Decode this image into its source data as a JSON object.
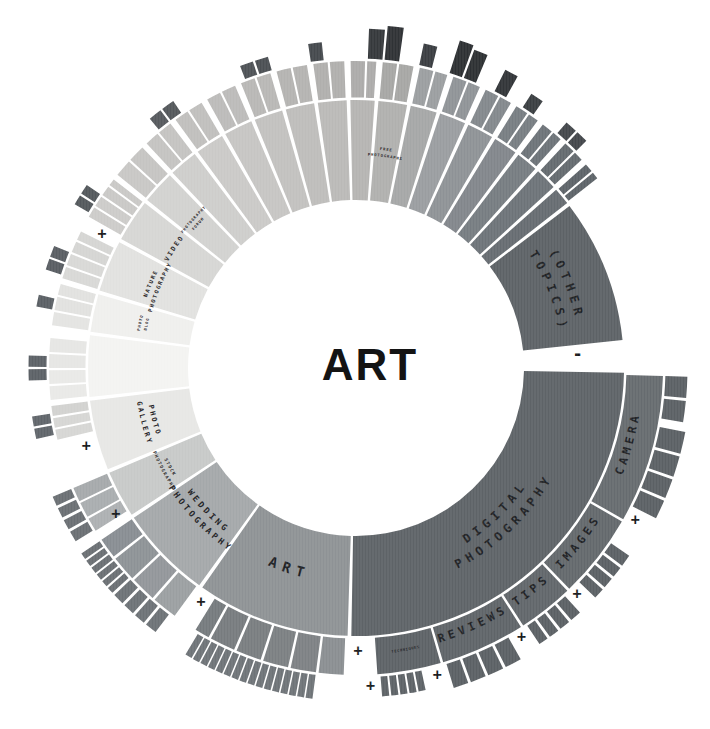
{
  "center": {
    "label": "ART"
  },
  "chart_data": {
    "type": "sunburst",
    "title": "ART",
    "geometry": {
      "cx": 356,
      "cy": 368,
      "ring1": [
        168,
        268
      ],
      "ring2": [
        270.5,
        307
      ],
      "ring3_base": 309.5,
      "label_r1": 216,
      "label_r2": 287
    },
    "ring1": [
      {
        "id": "digital-photography",
        "a0": 91,
        "a1": 181,
        "color": "#5e6367",
        "lines": [
          "DIGITAL",
          "PHOTOGRAPHY"
        ],
        "fs": 12,
        "ls": 5
      },
      {
        "id": "art",
        "a0": 181.8,
        "a1": 215,
        "color": "#8e9295",
        "lines": [
          "ART"
        ],
        "fs": 14,
        "ls": 6
      },
      {
        "id": "wedding-photography",
        "a0": 215.8,
        "a1": 236,
        "color": "#a4a8aa",
        "lines": [
          "WEDDING",
          "PHOTOGRAPHY"
        ],
        "fs": 8.5,
        "ls": 3
      },
      {
        "id": "stock-photography",
        "a0": 236.8,
        "a1": 247,
        "color": "#c7c9c8",
        "lines": [
          "STOCK",
          "PHOTOGRAPHY"
        ],
        "fs": 4.5,
        "ls": 1.2,
        "lc": "#55585a"
      },
      {
        "id": "photo-gallery",
        "a0": 247.8,
        "a1": 263,
        "color": "#e7e7e5",
        "lines": [
          "PHOTO",
          "GALLERY"
        ],
        "fs": 7,
        "ls": 2.2,
        "lc": "#4a4c4e"
      },
      {
        "id": "untitled-pale",
        "a0": 263.8,
        "a1": 277,
        "color": "#f3f3f1"
      },
      {
        "id": "photo-blog",
        "a0": 277.8,
        "a1": 286,
        "color": "#efefed",
        "lines": [
          "PHOTO",
          "BLOG"
        ],
        "fs": 3.8,
        "ls": 1,
        "lc": "#77797a"
      },
      {
        "id": "nature-photography",
        "a0": 286.8,
        "a1": 298,
        "color": "#e1e1df",
        "lines": [
          "NATURE",
          "PHOTOGRAPHY"
        ],
        "fs": 5.5,
        "ls": 1.5,
        "lc": "#55585a"
      },
      {
        "id": "video",
        "a0": 298.8,
        "a1": 308,
        "color": "#d6d6d4",
        "lines": [
          "VIDEO"
        ],
        "fs": 6.5,
        "ls": 2,
        "lc": "#3c3f41"
      },
      {
        "id": "photography-forum",
        "a0": 308.8,
        "a1": 316,
        "color": "#d2d2d0",
        "lines": [
          "PHOTOGRAPHY",
          "FORUM"
        ],
        "fs": 3.8,
        "ls": 0.9,
        "lc": "#55585a"
      },
      {
        "a0": 316.8,
        "a1": 323,
        "color": "#cecdcb"
      },
      {
        "a0": 323.8,
        "a1": 330,
        "color": "#cac9c7"
      },
      {
        "a0": 330.8,
        "a1": 337,
        "color": "#c6c5c3"
      },
      {
        "a0": 337.8,
        "a1": 344,
        "color": "#c2c1bf"
      },
      {
        "a0": 344.8,
        "a1": 351,
        "color": "#bebdbb"
      },
      {
        "a0": 351.8,
        "a1": 358,
        "color": "#bab9b7"
      },
      {
        "a0": 358.8,
        "a1": 364,
        "color": "#b5b4b2"
      },
      {
        "id": "free-photographs",
        "a0": 364.8,
        "a1": 371,
        "color": "#b0b0ae",
        "lines": [
          "FREE",
          "PHOTOGRAPHS"
        ],
        "fs": 3.8,
        "ls": 0.9,
        "lc": "#55585a"
      },
      {
        "a0": 371.8,
        "a1": 377.5,
        "color": "#a5a7a7"
      },
      {
        "a0": 378.3,
        "a1": 384,
        "color": "#9a9da0"
      },
      {
        "a0": 384.8,
        "a1": 390.5,
        "color": "#8e9296"
      },
      {
        "a0": 391.3,
        "a1": 396.5,
        "color": "#82868b"
      },
      {
        "a0": 397.3,
        "a1": 402,
        "color": "#767c81"
      },
      {
        "a0": 402.8,
        "a1": 407.5,
        "color": "#6d7378"
      },
      {
        "a0": 408.3,
        "a1": 412,
        "color": "#666c71"
      },
      {
        "id": "other-topics",
        "a0": 412.8,
        "a1": 444,
        "color": "#5d6266",
        "lines": [
          "(OTHER",
          "TOPICS)"
        ],
        "fs": 12,
        "ls": 5
      }
    ],
    "ring2": [
      {
        "id": "camera",
        "a0": 91.5,
        "a1": 119.5,
        "color": "#666b6f",
        "lines": [
          "CAMERA"
        ],
        "fs": 11.5,
        "ls": 4
      },
      {
        "id": "images",
        "a0": 120,
        "a1": 136,
        "color": "#63686c",
        "lines": [
          "IMAGES"
        ],
        "fs": 11.5,
        "ls": 4
      },
      {
        "id": "tips",
        "a0": 136.5,
        "a1": 147,
        "color": "#61666a",
        "lines": [
          "TIPS"
        ],
        "fs": 11.5,
        "ls": 4
      },
      {
        "id": "reviews",
        "a0": 147.5,
        "a1": 163.5,
        "color": "#5f6468",
        "lines": [
          "REVIEWS"
        ],
        "fs": 11.5,
        "ls": 4
      },
      {
        "id": "techniques",
        "a0": 164,
        "a1": 176,
        "color": "#5d6266",
        "lines": [
          "TECHNIQUES"
        ],
        "fs": 3.6,
        "ls": 0.7,
        "lc": "#2c2f31"
      },
      {
        "a0": 182.3,
        "a1": 187,
        "color": "#8a8e91"
      },
      {
        "a0": 187.5,
        "a1": 192.3,
        "color": "#7d8184"
      },
      {
        "a0": 192.8,
        "a1": 197.6,
        "color": "#7b7f82"
      },
      {
        "a0": 198.1,
        "a1": 202.9,
        "color": "#797d80"
      },
      {
        "a0": 203.4,
        "a1": 208.2,
        "color": "#777b7e"
      },
      {
        "a0": 208.7,
        "a1": 211.5,
        "color": "#757a7d"
      },
      {
        "a0": 216.2,
        "a1": 221,
        "color": "#9b9fa1"
      },
      {
        "a0": 221.5,
        "a1": 226.3,
        "color": "#92969a"
      },
      {
        "a0": 226.8,
        "a1": 231.6,
        "color": "#8d9296"
      },
      {
        "a0": 232.1,
        "a1": 236,
        "color": "#888d92"
      },
      {
        "a0": 238,
        "a1": 240.6,
        "color": "#adb0b2"
      },
      {
        "a0": 241,
        "a1": 243.9,
        "color": "#a9adaf"
      },
      {
        "a0": 244.3,
        "a1": 247,
        "color": "#a5a9ab"
      },
      {
        "a0": 256.5,
        "a1": 258.4,
        "color": "#d6d6d4"
      },
      {
        "a0": 258.8,
        "a1": 260.6,
        "color": "#d6d6d4"
      },
      {
        "a0": 261,
        "a1": 262.9,
        "color": "#d2d2d0"
      },
      {
        "a0": 264,
        "a1": 266.6,
        "color": "#e9e9e7"
      },
      {
        "a0": 267,
        "a1": 269.6,
        "color": "#e9e9e7"
      },
      {
        "a0": 270,
        "a1": 272.6,
        "color": "#e6e6e4"
      },
      {
        "a0": 273,
        "a1": 275.6,
        "color": "#e6e6e4"
      },
      {
        "a0": 278,
        "a1": 280.5,
        "color": "#e4e4e2"
      },
      {
        "a0": 280.9,
        "a1": 283.4,
        "color": "#e1e1df"
      },
      {
        "a0": 283.8,
        "a1": 285.9,
        "color": "#e1e1df"
      },
      {
        "a0": 287,
        "a1": 289.2,
        "color": "#d8d8d6"
      },
      {
        "a0": 289.6,
        "a1": 291.8,
        "color": "#d8d8d6"
      },
      {
        "a0": 292.2,
        "a1": 294.3,
        "color": "#d5d5d3"
      },
      {
        "a0": 294.7,
        "a1": 296.4,
        "color": "#d5d5d3"
      },
      {
        "a0": 299.5,
        "a1": 301.5,
        "color": "#cccbc9"
      },
      {
        "a0": 301.9,
        "a1": 303.9,
        "color": "#cccbc9"
      },
      {
        "a0": 304.3,
        "a1": 306.2,
        "color": "#c9c8c6"
      },
      {
        "a0": 306.6,
        "a1": 307.9,
        "color": "#c9c8c6"
      },
      {
        "a0": 309,
        "a1": 312.3,
        "color": "#c8c7c5"
      },
      {
        "a0": 312.7,
        "a1": 315.9,
        "color": "#c5c4c2"
      },
      {
        "a0": 317,
        "a1": 319.7,
        "color": "#c4c3c1"
      },
      {
        "a0": 320.1,
        "a1": 322.8,
        "color": "#c4c3c1"
      },
      {
        "a0": 324,
        "a1": 326.7,
        "color": "#c0bfbd"
      },
      {
        "a0": 327.1,
        "a1": 329.8,
        "color": "#c0bfbd"
      },
      {
        "a0": 331,
        "a1": 333.7,
        "color": "#bcbbb9"
      },
      {
        "a0": 334.1,
        "a1": 336.8,
        "color": "#bcbbb9"
      },
      {
        "a0": 338,
        "a1": 340.7,
        "color": "#b8b7b5"
      },
      {
        "a0": 341.1,
        "a1": 343.8,
        "color": "#b8b7b5"
      },
      {
        "a0": 345,
        "a1": 347.7,
        "color": "#b4b3b1"
      },
      {
        "a0": 348.1,
        "a1": 350.8,
        "color": "#b4b3b1"
      },
      {
        "a0": 352,
        "a1": 354.7,
        "color": "#b0afad"
      },
      {
        "a0": 355.1,
        "a1": 357.8,
        "color": "#b0afad"
      },
      {
        "a0": 359,
        "a1": 361.7,
        "color": "#acabaa"
      },
      {
        "a0": 362.1,
        "a1": 363.8,
        "color": "#acabaa"
      },
      {
        "a0": 365,
        "a1": 367.7,
        "color": "#a6a6a4"
      },
      {
        "a0": 368.1,
        "a1": 370.8,
        "color": "#a6a6a4"
      },
      {
        "a0": 372,
        "a1": 374.6,
        "color": "#9b9ea0"
      },
      {
        "a0": 375,
        "a1": 377.3,
        "color": "#9b9ea0"
      },
      {
        "a0": 378.5,
        "a1": 381.1,
        "color": "#8f9397"
      },
      {
        "a0": 381.5,
        "a1": 383.8,
        "color": "#8f9397"
      },
      {
        "a0": 385,
        "a1": 387.6,
        "color": "#83888c"
      },
      {
        "a0": 388,
        "a1": 390.3,
        "color": "#83888c"
      },
      {
        "a0": 391.5,
        "a1": 393.9,
        "color": "#777d82"
      },
      {
        "a0": 394.3,
        "a1": 396.3,
        "color": "#777d82"
      },
      {
        "a0": 397.5,
        "a1": 399.6,
        "color": "#6d7378"
      },
      {
        "a0": 400,
        "a1": 401.8,
        "color": "#6d7378"
      },
      {
        "a0": 403,
        "a1": 405.1,
        "color": "#646a6f"
      },
      {
        "a0": 405.5,
        "a1": 407.3,
        "color": "#646a6f"
      },
      {
        "a0": 408.5,
        "a1": 410.1,
        "color": "#5d6368"
      },
      {
        "a0": 410.5,
        "a1": 411.8,
        "color": "#5d6368"
      }
    ],
    "ring3": [
      {
        "a0": 91.5,
        "a1": 95.2,
        "len": 22,
        "color": "#5b6064"
      },
      {
        "a0": 95.7,
        "a1": 99.4,
        "len": 22,
        "color": "#5b6064"
      },
      {
        "a0": 101,
        "a1": 104.8,
        "len": 26,
        "color": "#5b6064"
      },
      {
        "a0": 105.3,
        "a1": 108.9,
        "len": 26,
        "color": "#5b6064"
      },
      {
        "a0": 109.4,
        "a1": 112.8,
        "len": 26,
        "color": "#5b6064"
      },
      {
        "a0": 113.3,
        "a1": 116.6,
        "len": 26,
        "color": "#5b6064"
      },
      {
        "a0": 124.5,
        "a1": 126.6,
        "len": 22,
        "color": "#5b6064"
      },
      {
        "a0": 127.1,
        "a1": 129,
        "len": 22,
        "color": "#5b6064"
      },
      {
        "a0": 129.5,
        "a1": 131.4,
        "len": 22,
        "color": "#5b6064"
      },
      {
        "a0": 131.9,
        "a1": 133.8,
        "len": 22,
        "color": "#5b6064"
      },
      {
        "a0": 137.5,
        "a1": 139.5,
        "len": 22,
        "color": "#5b6064"
      },
      {
        "a0": 140,
        "a1": 141.9,
        "len": 22,
        "color": "#5b6064"
      },
      {
        "a0": 142.4,
        "a1": 144.2,
        "len": 22,
        "color": "#5b6064"
      },
      {
        "a0": 144.7,
        "a1": 146.4,
        "len": 22,
        "color": "#5b6064"
      },
      {
        "a0": 150.5,
        "a1": 153.4,
        "len": 25,
        "color": "#5b6064"
      },
      {
        "a0": 153.9,
        "a1": 156.7,
        "len": 25,
        "color": "#5b6064"
      },
      {
        "a0": 157.2,
        "a1": 159.9,
        "len": 25,
        "color": "#5b6064"
      },
      {
        "a0": 160.4,
        "a1": 163,
        "len": 25,
        "color": "#5b6064"
      },
      {
        "a0": 167.8,
        "count": 5,
        "w": 1.25,
        "gap": 0.35,
        "len": 20,
        "color": "#5d6266"
      },
      {
        "a0": 187.5,
        "count": 16,
        "w": 1.2,
        "gap": 0.27,
        "len": 24,
        "color": "#6e7377"
      },
      {
        "a0": 217.2,
        "a1": 219.3,
        "len": 22,
        "color": "#6d7276"
      },
      {
        "a0": 219.8,
        "a1": 221.8,
        "len": 22,
        "color": "#6d7276"
      },
      {
        "a0": 222.3,
        "a1": 224.3,
        "len": 22,
        "color": "#6d7276"
      },
      {
        "a0": 224.8,
        "a1": 226.8,
        "len": 22,
        "color": "#6d7276"
      },
      {
        "a0": 227.3,
        "count": 6,
        "w": 1.15,
        "gap": 0.35,
        "len": 22,
        "color": "#6a6f73"
      },
      {
        "a0": 238.3,
        "a1": 240.2,
        "len": 20,
        "color": "#6a6f73"
      },
      {
        "a0": 240.7,
        "a1": 242.5,
        "len": 20,
        "color": "#6a6f73"
      },
      {
        "a0": 243,
        "a1": 244.8,
        "len": 20,
        "color": "#6a6f73"
      },
      {
        "a0": 245.3,
        "a1": 247,
        "len": 20,
        "color": "#6a6f73"
      },
      {
        "a0": 257.5,
        "a1": 259.3,
        "len": 18,
        "color": "#60656a"
      },
      {
        "a0": 259.7,
        "a1": 261.5,
        "len": 18,
        "color": "#60656a"
      },
      {
        "a0": 267.8,
        "a1": 269.8,
        "len": 18,
        "color": "#5c6166"
      },
      {
        "a0": 270.2,
        "a1": 272.2,
        "len": 18,
        "color": "#5c6166"
      },
      {
        "a0": 280.9,
        "a1": 283,
        "len": 16,
        "color": "#5a5f64"
      },
      {
        "a0": 287.6,
        "a1": 289.6,
        "len": 16,
        "color": "#585d62"
      },
      {
        "a0": 290,
        "a1": 292,
        "len": 16,
        "color": "#585d62"
      },
      {
        "a0": 300.2,
        "a1": 302,
        "len": 16,
        "color": "#53585c"
      },
      {
        "a0": 302.4,
        "a1": 304.2,
        "len": 16,
        "color": "#53585c"
      },
      {
        "a0": 320.4,
        "a1": 322.8,
        "len": 14,
        "color": "#565a5e"
      },
      {
        "a0": 323.2,
        "a1": 325.6,
        "len": 14,
        "color": "#53575b"
      },
      {
        "a0": 339,
        "a1": 341.4,
        "len": 14,
        "color": "#4e5256"
      },
      {
        "a0": 341.8,
        "a1": 344.2,
        "len": 14,
        "color": "#4b4f53"
      },
      {
        "a0": 351.6,
        "a1": 354,
        "len": 18,
        "color": "#45494d"
      },
      {
        "a0": 362.2,
        "a1": 364.9,
        "len": 30,
        "color": "#35383b"
      },
      {
        "a0": 365.3,
        "a1": 368,
        "len": 34,
        "color": "#2f3235"
      },
      {
        "a0": 371.8,
        "a1": 374.2,
        "len": 22,
        "color": "#3a3d41"
      },
      {
        "a0": 377.6,
        "a1": 380,
        "len": 34,
        "color": "#2d3033"
      },
      {
        "a0": 380.4,
        "a1": 382.8,
        "len": 30,
        "color": "#2d3033"
      },
      {
        "a0": 386.6,
        "a1": 389,
        "len": 24,
        "color": "#323538"
      },
      {
        "a0": 392.6,
        "a1": 395,
        "len": 16,
        "color": "#3a3e41"
      },
      {
        "a0": 400.6,
        "a1": 402.8,
        "len": 14,
        "color": "#43474b"
      },
      {
        "a0": 403.2,
        "a1": 405.4,
        "len": 14,
        "color": "#43474b"
      }
    ],
    "markers": [
      {
        "glyph": "-",
        "a": 86.5,
        "r": 222
      },
      {
        "glyph": "+",
        "a": 118.6,
        "r": 318
      },
      {
        "glyph": "+",
        "a": 135.6,
        "r": 316
      },
      {
        "glyph": "+",
        "a": 148.4,
        "r": 316
      },
      {
        "glyph": "+",
        "a": 165.2,
        "r": 318
      },
      {
        "glyph": "+",
        "a": 177.4,
        "r": 318
      },
      {
        "glyph": "+",
        "a": 179.6,
        "r": 283
      },
      {
        "glyph": "+",
        "a": 213.5,
        "r": 281
      },
      {
        "glyph": "+",
        "a": 238.8,
        "r": 281
      },
      {
        "glyph": "+",
        "a": 253.8,
        "r": 281
      },
      {
        "glyph": "+",
        "a": 297.8,
        "r": 287
      }
    ]
  }
}
